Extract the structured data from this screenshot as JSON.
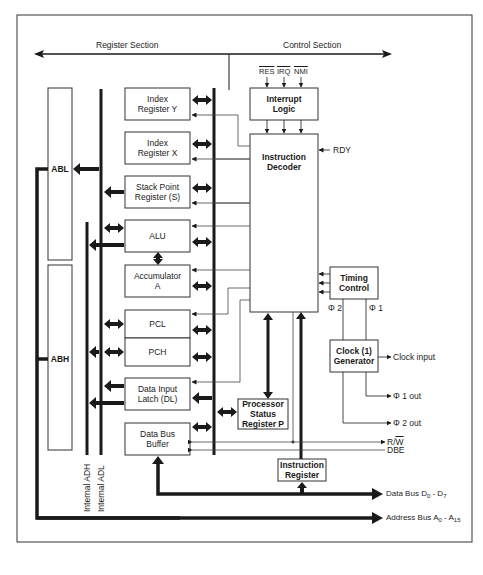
{
  "diagram": {
    "title_left": "Register Section",
    "title_right": "Control Section",
    "colors": {
      "line": "#1a1a1a",
      "box_border": "#333333",
      "background": "#ffffff"
    },
    "interrupt_inputs": [
      "RES",
      "IRQ",
      "NMI"
    ],
    "blocks": {
      "abl": "ABL",
      "abh": "ABH",
      "index_y": [
        "Index",
        "Register Y"
      ],
      "index_x": [
        "Index",
        "Register X"
      ],
      "stack_pointer": [
        "Stack Point",
        "Register (S)"
      ],
      "alu": "ALU",
      "accumulator": [
        "Accumulator",
        "A"
      ],
      "pcl": "PCL",
      "pch": "PCH",
      "data_input_latch": [
        "Data Input",
        "Latch (DL)"
      ],
      "data_bus_buffer": [
        "Data Bus",
        "Buffer"
      ],
      "interrupt_logic": [
        "Interrupt",
        "Logic"
      ],
      "instruction_decoder": [
        "Instruction",
        "Decoder"
      ],
      "timing_control": [
        "Timing",
        "Control"
      ],
      "clock_generator": [
        "Clock (1)",
        "Generator"
      ],
      "processor_status": [
        "Processor",
        "Status",
        "Register P"
      ],
      "instruction_register": [
        "Instruction",
        "Register"
      ]
    },
    "signals": {
      "rdy": "RDY",
      "phi2": "Φ 2",
      "phi1": "Φ 1",
      "clock_input": "Clock input",
      "phi1_out": "Φ 1 out",
      "phi2_out": "Φ 2 out",
      "rw": "R/W",
      "rw_bar": "W",
      "rw_prefix": "R/",
      "dbe": "DBE",
      "data_bus": "Data Bus D",
      "data_bus_sub0": "0",
      "data_bus_sep": " - D",
      "data_bus_sub1": "7",
      "address_bus": "Address Bus A",
      "address_bus_sub0": "0",
      "address_bus_sep": " - A",
      "address_bus_sub1": "15"
    },
    "bus_labels": {
      "internal_adh": "Internal ADH",
      "internal_adl": "Internal ADL"
    }
  }
}
